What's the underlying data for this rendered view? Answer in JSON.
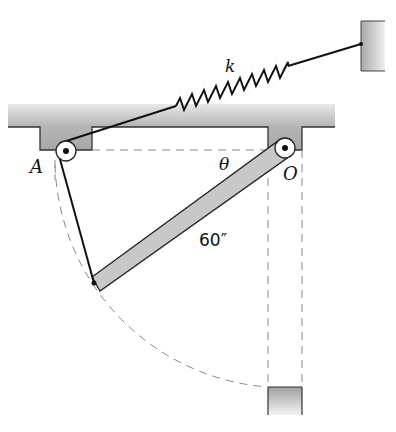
{
  "figure": {
    "type": "mechanics-diagram"
  },
  "labels": {
    "spring": "k",
    "pulley_left": "A",
    "pivot": "O",
    "angle": "θ",
    "bar_length": "60″"
  },
  "colors": {
    "fill_gray": "#c8c8c8",
    "stroke": "#222222",
    "dashed": "#888888"
  }
}
